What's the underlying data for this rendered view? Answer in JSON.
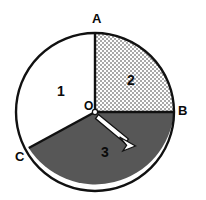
{
  "figure": {
    "type": "circle-sector-diagram",
    "canvas": {
      "width": 206,
      "height": 200,
      "background": "#ffffff"
    },
    "circle": {
      "center": {
        "x": 95,
        "y": 112
      },
      "radius": 79,
      "stroke_color": "#111111",
      "stroke_width": 2.2
    },
    "vertices": [
      {
        "id": "A",
        "label": "A",
        "x": 95,
        "y": 33,
        "angle_deg": 90,
        "description": "top of circle"
      },
      {
        "id": "B",
        "label": "B",
        "x": 174,
        "y": 112,
        "angle_deg": 0,
        "description": "right of circle"
      },
      {
        "id": "C",
        "label": "C",
        "x": 33,
        "y": 152,
        "angle_deg": 213,
        "description": "lower-left of circle"
      },
      {
        "id": "O",
        "label": "O",
        "x": 95,
        "y": 112,
        "angle_deg": null,
        "description": "center of circle"
      }
    ],
    "radii": [
      {
        "id": "OA",
        "from": "O",
        "to": "A"
      },
      {
        "id": "OB",
        "from": "O",
        "to": "B"
      },
      {
        "id": "OC",
        "from": "O",
        "to": "C"
      }
    ],
    "sectors": [
      {
        "id": "1",
        "label": "1",
        "fill": "white",
        "fill_color": "#ffffff",
        "pattern": "none",
        "start_angle_deg": 90,
        "end_angle_deg": 213,
        "between": "A to C (counterclockwise)",
        "label_x": 61,
        "label_y": 91
      },
      {
        "id": "2",
        "label": "2",
        "fill": "checkered",
        "fill_color": "#b8b8b8",
        "pattern": "fine checkerboard dots",
        "start_angle_deg": 0,
        "end_angle_deg": 90,
        "between": "A to B (clockwise)",
        "label_x": 131,
        "label_y": 80
      },
      {
        "id": "3",
        "label": "3",
        "fill": "dark-gray",
        "fill_color": "#575757",
        "pattern": "solid",
        "start_angle_deg": 213,
        "end_angle_deg": 360,
        "between": "B to C (clockwise)",
        "label_x": 105,
        "label_y": 152
      }
    ],
    "arrow": {
      "name": "radius-arrow",
      "from": {
        "x": 98,
        "y": 114
      },
      "to": {
        "x": 133,
        "y": 143
      },
      "fill_color": "#ffffff",
      "stroke_color": "#111111",
      "description": "white outlined arrow from center O into sector 3"
    },
    "colors": {
      "outline": "#111111",
      "sector_white": "#ffffff",
      "sector_checkered": "#b8b8b8",
      "sector_dark": "#575757",
      "label_text": "#0a0a0a",
      "arrow_fill": "#ffffff"
    }
  }
}
